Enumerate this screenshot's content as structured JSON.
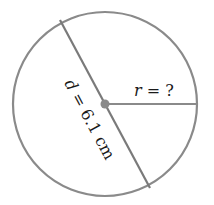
{
  "diagram": {
    "type": "circle-diameter-radius",
    "colors": {
      "stroke": "#8a8a8a",
      "center_dot": "#8a8a8a",
      "text": "#1a1a1a",
      "background": "#ffffff"
    },
    "circle": {
      "cx": 105,
      "cy": 104,
      "r": 92
    },
    "diameter": {
      "x1": 60,
      "y1": 20,
      "x2": 150,
      "y2": 188,
      "label_var": "d",
      "label_eq": " = 6.1 cm",
      "value": 6.1,
      "unit": "cm"
    },
    "radius": {
      "x1": 105,
      "y1": 104,
      "x2": 197,
      "y2": 104,
      "label_var": "r",
      "label_eq": " = ?"
    }
  }
}
